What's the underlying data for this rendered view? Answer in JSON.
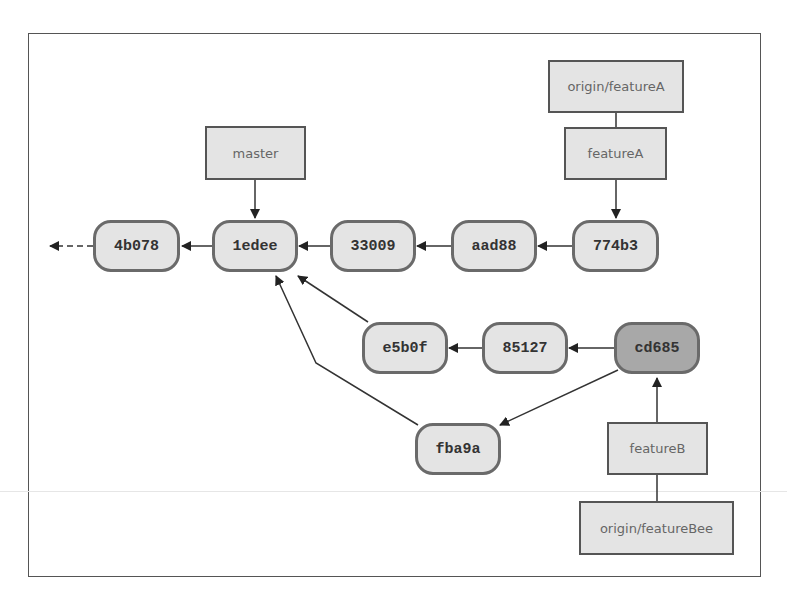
{
  "diagram": {
    "type": "git-commit-graph",
    "commits": [
      {
        "id": "4b078"
      },
      {
        "id": "1edee"
      },
      {
        "id": "33009"
      },
      {
        "id": "aad88"
      },
      {
        "id": "774b3"
      },
      {
        "id": "e5b0f"
      },
      {
        "id": "85127"
      },
      {
        "id": "cd685",
        "highlighted": true
      },
      {
        "id": "fba9a"
      }
    ],
    "refs": [
      {
        "label": "master",
        "points_to": "1edee"
      },
      {
        "label": "origin/featureA",
        "points_to": "774b3"
      },
      {
        "label": "featureA",
        "points_to": "774b3"
      },
      {
        "label": "featureB",
        "points_to": "cd685"
      },
      {
        "label": "origin/featureBee",
        "points_to": "cd685"
      }
    ],
    "edges": [
      [
        "1edee",
        "4b078"
      ],
      [
        "33009",
        "1edee"
      ],
      [
        "aad88",
        "33009"
      ],
      [
        "774b3",
        "aad88"
      ],
      [
        "85127",
        "e5b0f"
      ],
      [
        "cd685",
        "85127"
      ],
      [
        "cd685",
        "fba9a"
      ],
      [
        "e5b0f",
        "1edee"
      ],
      [
        "fba9a",
        "1edee"
      ]
    ],
    "colors": {
      "commit_fill": "#e4e4e4",
      "head_fill": "#a8a8a8",
      "border": "#6a6a6a",
      "ref_text": "#666666"
    }
  }
}
